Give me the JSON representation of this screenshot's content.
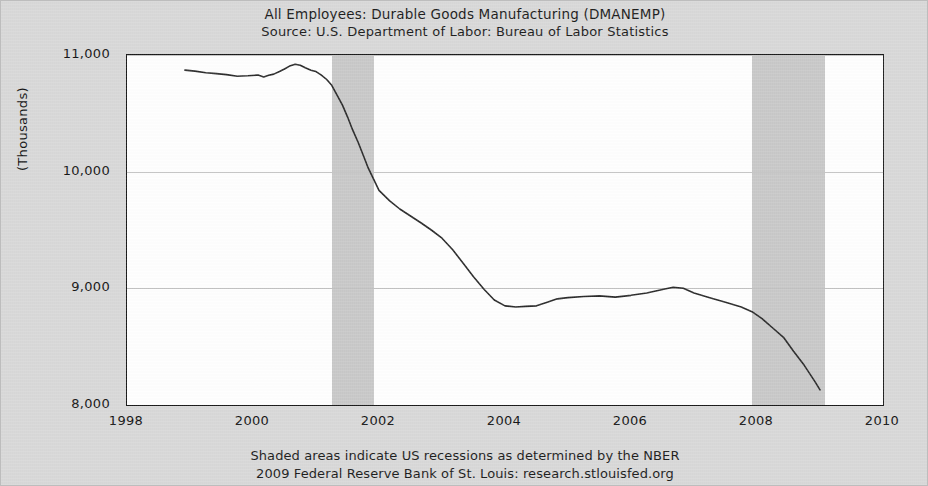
{
  "title": {
    "line1": "All Employees: Durable Goods Manufacturing (DMANEMP)",
    "line2": "Source: U.S. Department of Labor: Bureau of Labor Statistics"
  },
  "footer": {
    "line1": "Shaded areas indicate US recessions as determined by the NBER",
    "line2": "2009 Federal Reserve Bank of St. Louis: research.stlouisfed.org"
  },
  "colors": {
    "page_background": "#d9d9d9",
    "plot_background": "#ffffff",
    "axis": "#1a1a1a",
    "series_line": "#2b2b2b",
    "recession_band": "#c9c9c9",
    "gridline": "#c2c2c2"
  },
  "chart_data": {
    "type": "line",
    "title": "All Employees: Durable Goods Manufacturing (DMANEMP)",
    "subtitle": "Source: U.S. Department of Labor: Bureau of Labor Statistics",
    "xlabel": "",
    "ylabel": "(Thousands)",
    "xlim": [
      1998,
      2010
    ],
    "ylim": [
      8000,
      11000
    ],
    "grid": true,
    "legend": null,
    "xticks": [
      1998,
      2000,
      2002,
      2004,
      2006,
      2008,
      2010
    ],
    "xtick_labels": [
      "1998",
      "2000",
      "2002",
      "2004",
      "2006",
      "2008",
      "2010"
    ],
    "yticks": [
      8000,
      9000,
      10000,
      11000
    ],
    "ytick_labels": [
      "8,000",
      "9,000",
      "10,000",
      "11,000"
    ],
    "shaded_regions": [
      {
        "label": "US recession",
        "x_start": 2001.25,
        "x_end": 2001.92
      },
      {
        "label": "US recession",
        "x_start": 2007.92,
        "x_end": 2009.08
      }
    ],
    "series": [
      {
        "name": "DMANEMP",
        "x": [
          1998.92,
          1999.08,
          1999.25,
          1999.42,
          1999.58,
          1999.75,
          1999.92,
          2000.08,
          2000.17,
          2000.25,
          2000.33,
          2000.42,
          2000.5,
          2000.58,
          2000.67,
          2000.75,
          2000.83,
          2000.92,
          2001.0,
          2001.08,
          2001.17,
          2001.25,
          2001.33,
          2001.42,
          2001.5,
          2001.58,
          2001.67,
          2001.75,
          2001.83,
          2001.92,
          2002.0,
          2002.17,
          2002.33,
          2002.5,
          2002.67,
          2002.83,
          2003.0,
          2003.17,
          2003.33,
          2003.5,
          2003.67,
          2003.83,
          2004.0,
          2004.17,
          2004.33,
          2004.5,
          2004.67,
          2004.83,
          2005.0,
          2005.25,
          2005.5,
          2005.75,
          2006.0,
          2006.25,
          2006.5,
          2006.67,
          2006.83,
          2007.0,
          2007.25,
          2007.5,
          2007.75,
          2007.92,
          2008.08,
          2008.25,
          2008.42,
          2008.58,
          2008.75,
          2008.92,
          2009.0
        ],
        "y": [
          10870,
          10862,
          10848,
          10840,
          10832,
          10818,
          10822,
          10828,
          10812,
          10826,
          10836,
          10858,
          10880,
          10905,
          10920,
          10912,
          10890,
          10870,
          10858,
          10830,
          10790,
          10740,
          10660,
          10570,
          10470,
          10360,
          10250,
          10140,
          10030,
          9930,
          9840,
          9750,
          9680,
          9620,
          9560,
          9500,
          9430,
          9330,
          9220,
          9100,
          8990,
          8900,
          8850,
          8840,
          8845,
          8850,
          8880,
          8910,
          8920,
          8930,
          8935,
          8925,
          8940,
          8960,
          8990,
          9010,
          9000,
          8960,
          8920,
          8880,
          8840,
          8800,
          8740,
          8660,
          8580,
          8460,
          8340,
          8200,
          8130
        ]
      }
    ]
  },
  "axes": {
    "ylabel": "(Thousands)"
  }
}
